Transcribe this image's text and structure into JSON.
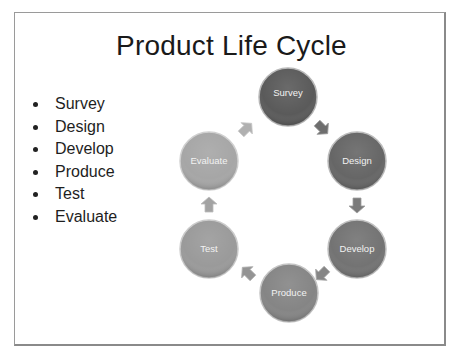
{
  "slide": {
    "title": "Product Life Cycle",
    "bullets": [
      "Survey",
      "Design",
      "Develop",
      "Produce",
      "Test",
      "Evaluate"
    ]
  },
  "diagram": {
    "type": "cycle",
    "nodes": [
      {
        "label": "Survey",
        "color": "#5a5a5a"
      },
      {
        "label": "Design",
        "color": "#666666"
      },
      {
        "label": "Develop",
        "color": "#737373"
      },
      {
        "label": "Produce",
        "color": "#858585"
      },
      {
        "label": "Test",
        "color": "#9a9a9a"
      },
      {
        "label": "Evaluate",
        "color": "#a6a6a6"
      }
    ],
    "arrow_colors": [
      "#6e6e6e",
      "#7a7a7a",
      "#868686",
      "#949494",
      "#a3a3a3",
      "#b0b0b0"
    ]
  }
}
